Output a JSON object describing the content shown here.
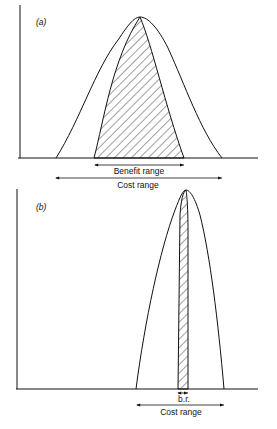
{
  "figure": {
    "panels": [
      {
        "id": "a",
        "label": "(a)",
        "benefit_range_label": "Benefit range",
        "cost_range_label": "Cost range"
      },
      {
        "id": "b",
        "label": "(b)",
        "benefit_range_label": "b.r.",
        "cost_range_label": "Cost range"
      }
    ],
    "colors": {
      "line": "#111111",
      "background": "#ffffff"
    }
  }
}
